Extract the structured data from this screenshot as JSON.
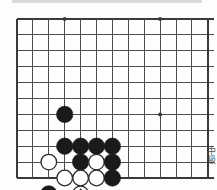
{
  "figure": {
    "kind": "go-board-diagram",
    "caption_vertical": "中級",
    "board": {
      "left_px": 17,
      "top_px": 19,
      "spacing_px": 15.9,
      "cols": 12,
      "rows": 10,
      "right_edge_px": 193,
      "bottom_edge_px": 173,
      "line_color": "#4d4d4d",
      "edge_color": "#3a3a3a",
      "background": "#ffffff",
      "overhang_px": 6
    },
    "star_points": [
      {
        "col": 3,
        "row": 0
      },
      {
        "col": 9,
        "row": 0
      },
      {
        "col": 9,
        "row": 6
      }
    ],
    "stones": [
      {
        "col": 3,
        "row": 6,
        "color": "black",
        "mark": "none"
      },
      {
        "col": 3,
        "row": 8,
        "color": "black",
        "mark": "none"
      },
      {
        "col": 2,
        "row": 9,
        "color": "white",
        "mark": "none"
      },
      {
        "col": 4,
        "row": 8,
        "color": "black",
        "mark": "none"
      },
      {
        "col": 5,
        "row": 8,
        "color": "black",
        "mark": "none"
      },
      {
        "col": 6,
        "row": 8,
        "color": "black",
        "mark": "none"
      },
      {
        "col": 4,
        "row": 9,
        "color": "black",
        "mark": "none"
      },
      {
        "col": 5,
        "row": 9,
        "color": "white",
        "mark": "none"
      },
      {
        "col": 6,
        "row": 9,
        "color": "black",
        "mark": "none"
      },
      {
        "col": 3,
        "row": 10,
        "color": "white",
        "mark": "none"
      },
      {
        "col": 4,
        "row": 10,
        "color": "white",
        "mark": "none"
      },
      {
        "col": 5,
        "row": 10,
        "color": "white",
        "mark": "none"
      },
      {
        "col": 6,
        "row": 10,
        "color": "black",
        "mark": "none"
      },
      {
        "col": 2,
        "row": 11,
        "color": "black",
        "mark": "none"
      },
      {
        "col": 4,
        "row": 11,
        "color": "white",
        "mark": "triangle"
      }
    ],
    "colors": {
      "black_stone": "#1a1a1a",
      "white_stone_fill": "#ffffff",
      "white_stone_stroke": "#2b2b2b",
      "triangle_mark": "#1a1a1a",
      "grid": "#4d4d4d"
    },
    "stone_radius_px": 8.2
  }
}
